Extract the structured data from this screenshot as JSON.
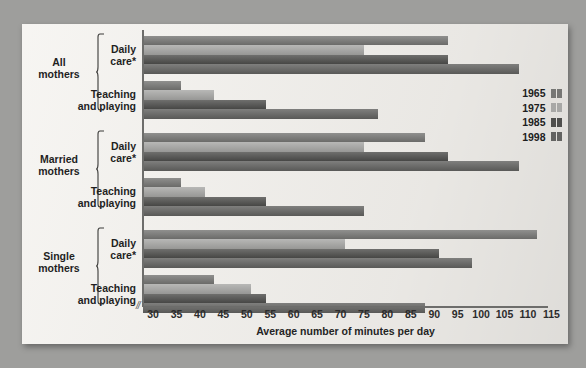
{
  "chart_data": {
    "type": "bar",
    "orientation": "horizontal",
    "title": "",
    "xlabel": "Average number of minutes per day",
    "ylabel": "",
    "xlim": [
      28,
      115
    ],
    "axis_break": "//",
    "grid": false,
    "legend_position": "right",
    "ticks": [
      30,
      35,
      40,
      45,
      50,
      55,
      60,
      65,
      70,
      75,
      80,
      85,
      90,
      95,
      100,
      105,
      110,
      115
    ],
    "legend": [
      {
        "name": "1965",
        "color": "#777775"
      },
      {
        "name": "1975",
        "color": "#a8a8a6"
      },
      {
        "name": "1985",
        "color": "#4f4f4d"
      },
      {
        "name": "1998",
        "color": "#636361"
      }
    ],
    "groups": [
      {
        "label": "All\nmothers",
        "label_line1": "All",
        "label_line2": "mothers",
        "subgroups": [
          {
            "label_line1": "Daily",
            "label_line2": "care*",
            "values": [
              93,
              75,
              93,
              108
            ]
          },
          {
            "label_line1": "Teaching",
            "label_line2": "and playing",
            "values": [
              36,
              43,
              54,
              78
            ]
          }
        ]
      },
      {
        "label": "Married\nmothers",
        "label_line1": "Married",
        "label_line2": "mothers",
        "subgroups": [
          {
            "label_line1": "Daily",
            "label_line2": "care*",
            "values": [
              88,
              75,
              93,
              108
            ]
          },
          {
            "label_line1": "Teaching",
            "label_line2": "and playing",
            "values": [
              36,
              41,
              54,
              75
            ]
          }
        ]
      },
      {
        "label": "Single\nmothers",
        "label_line1": "Single",
        "label_line2": "mothers",
        "subgroups": [
          {
            "label_line1": "Daily",
            "label_line2": "care*",
            "values": [
              112,
              71,
              91,
              98
            ]
          },
          {
            "label_line1": "Teaching",
            "label_line2": "and playing",
            "values": [
              43,
              51,
              54,
              88
            ]
          }
        ]
      }
    ],
    "series": [
      {
        "name": "1965",
        "values": [
          93,
          36,
          88,
          36,
          112,
          43
        ]
      },
      {
        "name": "1975",
        "values": [
          75,
          43,
          75,
          41,
          71,
          51
        ]
      },
      {
        "name": "1985",
        "values": [
          93,
          54,
          93,
          54,
          91,
          54
        ]
      },
      {
        "name": "1998",
        "values": [
          108,
          78,
          108,
          75,
          98,
          88
        ]
      }
    ],
    "categories": [
      "All mothers - Daily care*",
      "All mothers - Teaching and playing",
      "Married mothers - Daily care*",
      "Married mothers - Teaching and playing",
      "Single mothers - Daily care*",
      "Single mothers - Teaching and playing"
    ]
  },
  "labels": {
    "tick_30": "30",
    "tick_35": "35",
    "tick_40": "40",
    "tick_45": "45",
    "tick_50": "50",
    "tick_55": "55",
    "tick_60": "60",
    "tick_65": "65",
    "tick_70": "70",
    "tick_75": "75",
    "tick_80": "80",
    "tick_85": "85",
    "tick_90": "90",
    "tick_95": "95",
    "tick_100": "100",
    "tick_105": "105",
    "tick_110": "110",
    "tick_115": "115",
    "axis_break": "//"
  }
}
